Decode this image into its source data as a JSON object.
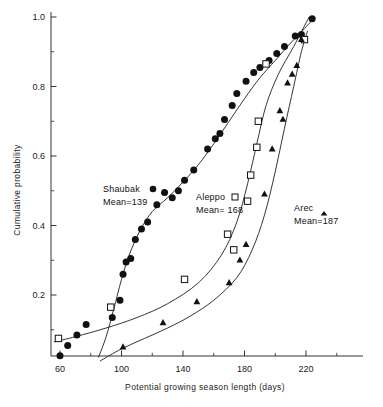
{
  "chart_data": {
    "type": "scatter",
    "title": "",
    "xlabel": "Potential growing season length (days)",
    "ylabel": "Cumulative probability",
    "xlim": [
      52,
      255
    ],
    "ylim": [
      0.0,
      1.02
    ],
    "xticks": [
      60,
      100,
      140,
      180,
      220
    ],
    "xticks_minor": [
      80,
      120,
      160,
      200,
      240
    ],
    "yticks": [
      0.2,
      0.4,
      0.6,
      0.8,
      1.0
    ],
    "yticks_minor": [
      0.1,
      0.3,
      0.5,
      0.7,
      0.9
    ],
    "grid": false,
    "legend_position": "inside-plot",
    "series": [
      {
        "name": "Shaubak",
        "marker": "filled-circle",
        "mean": 139,
        "label": "Shaubak",
        "mean_label": "Mean=139",
        "points": [
          [
            60,
            0.025
          ],
          [
            65,
            0.055
          ],
          [
            71,
            0.085
          ],
          [
            77,
            0.115
          ],
          [
            94,
            0.135
          ],
          [
            99,
            0.185
          ],
          [
            101,
            0.26
          ],
          [
            103,
            0.295
          ],
          [
            106,
            0.305
          ],
          [
            109,
            0.36
          ],
          [
            113,
            0.39
          ],
          [
            117,
            0.41
          ],
          [
            123,
            0.46
          ],
          [
            128,
            0.495
          ],
          [
            133,
            0.48
          ],
          [
            137,
            0.5
          ],
          [
            141,
            0.53
          ],
          [
            147,
            0.56
          ],
          [
            156,
            0.62
          ],
          [
            161,
            0.65
          ],
          [
            164,
            0.665
          ],
          [
            167,
            0.705
          ],
          [
            172,
            0.745
          ],
          [
            175,
            0.78
          ],
          [
            181,
            0.815
          ],
          [
            186,
            0.84
          ],
          [
            190,
            0.855
          ],
          [
            196,
            0.875
          ],
          [
            201,
            0.895
          ],
          [
            206,
            0.915
          ],
          [
            213,
            0.945
          ],
          [
            217,
            0.95
          ],
          [
            224,
            0.995
          ]
        ],
        "curve": [
          [
            85,
            0.02
          ],
          [
            90,
            0.08
          ],
          [
            95,
            0.16
          ],
          [
            100,
            0.245
          ],
          [
            105,
            0.315
          ],
          [
            112,
            0.385
          ],
          [
            120,
            0.44
          ],
          [
            130,
            0.48
          ],
          [
            140,
            0.525
          ],
          [
            150,
            0.575
          ],
          [
            160,
            0.635
          ],
          [
            170,
            0.7
          ],
          [
            180,
            0.765
          ],
          [
            190,
            0.825
          ],
          [
            200,
            0.875
          ],
          [
            210,
            0.925
          ],
          [
            218,
            0.962
          ],
          [
            226,
            1.0
          ]
        ]
      },
      {
        "name": "Aleppo",
        "marker": "open-square",
        "mean": 168,
        "label": "Aleppo",
        "mean_label": "Mean= 168",
        "points": [
          [
            59,
            0.075
          ],
          [
            93,
            0.165
          ],
          [
            141,
            0.245
          ],
          [
            169,
            0.375
          ],
          [
            173,
            0.33
          ],
          [
            182,
            0.47
          ],
          [
            184,
            0.545
          ],
          [
            188,
            0.625
          ],
          [
            189,
            0.7
          ],
          [
            194,
            0.865
          ],
          [
            219,
            0.935
          ]
        ],
        "curve": [
          [
            56,
            0.065
          ],
          [
            70,
            0.08
          ],
          [
            90,
            0.105
          ],
          [
            110,
            0.135
          ],
          [
            130,
            0.175
          ],
          [
            150,
            0.235
          ],
          [
            165,
            0.315
          ],
          [
            175,
            0.41
          ],
          [
            182,
            0.52
          ],
          [
            188,
            0.635
          ],
          [
            194,
            0.745
          ],
          [
            202,
            0.835
          ],
          [
            212,
            0.915
          ],
          [
            222,
            1.0
          ]
        ]
      },
      {
        "name": "Arec",
        "marker": "filled-triangle",
        "mean": 187,
        "label": "Arec",
        "mean_label": "Mean=187",
        "points": [
          [
            101,
            0.05
          ],
          [
            127,
            0.12
          ],
          [
            149,
            0.18
          ],
          [
            170,
            0.235
          ],
          [
            177,
            0.3
          ],
          [
            181,
            0.345
          ],
          [
            193,
            0.49
          ],
          [
            198,
            0.62
          ],
          [
            203,
            0.73
          ],
          [
            205,
            0.705
          ],
          [
            208,
            0.81
          ],
          [
            211,
            0.835
          ],
          [
            214,
            0.86
          ],
          [
            217,
            0.935
          ]
        ],
        "curve": [
          [
            86,
            0.01
          ],
          [
            100,
            0.045
          ],
          [
            115,
            0.075
          ],
          [
            130,
            0.105
          ],
          [
            145,
            0.14
          ],
          [
            160,
            0.185
          ],
          [
            175,
            0.25
          ],
          [
            185,
            0.33
          ],
          [
            193,
            0.43
          ],
          [
            200,
            0.555
          ],
          [
            206,
            0.68
          ],
          [
            212,
            0.8
          ],
          [
            217,
            0.9
          ],
          [
            221,
            0.96
          ]
        ]
      }
    ]
  },
  "axes": {
    "x_tick_labels": [
      "60",
      "100",
      "140",
      "180",
      "220"
    ],
    "y_tick_labels": [
      "0.2",
      "0.4",
      "0.6",
      "0.8",
      "1.0"
    ]
  }
}
